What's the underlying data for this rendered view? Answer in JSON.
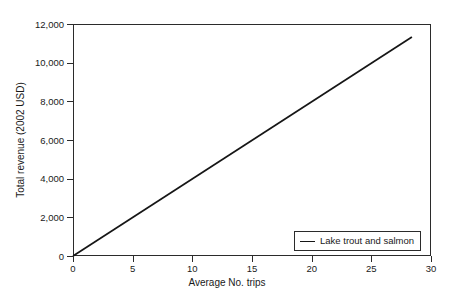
{
  "chart_data": {
    "type": "line",
    "title": "",
    "subtitle": "",
    "xlabel": "Average No. trips",
    "ylabel": "Total revenue (2002 USD)",
    "xlim": [
      0,
      30
    ],
    "ylim": [
      0,
      12000
    ],
    "xticks": [
      0,
      5,
      10,
      15,
      20,
      25,
      30
    ],
    "xtick_labels": [
      "0",
      "5",
      "10",
      "15",
      "20",
      "25",
      "30"
    ],
    "yticks": [
      0,
      2000,
      4000,
      6000,
      8000,
      10000,
      12000
    ],
    "ytick_labels": [
      "0",
      "2,000",
      "4,000",
      "6,000",
      "8,000",
      "10,000",
      "12,000"
    ],
    "grid": false,
    "legend_position": "bottom-right",
    "series": [
      {
        "name": "Lake trout and salmon",
        "color": "#161616",
        "marker": "none",
        "x": [
          0,
          28.4
        ],
        "values": [
          0,
          11330
        ]
      }
    ],
    "annotations": []
  },
  "legend": {
    "entries": [
      {
        "label": "Lake trout and salmon"
      }
    ]
  }
}
